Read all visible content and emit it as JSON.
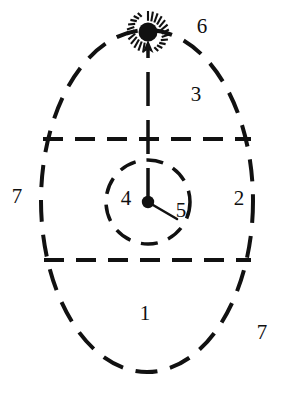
{
  "figure": {
    "type": "schematic-cross-section",
    "background_color": "#ffffff",
    "line_color": "#111111",
    "line_style": "dashed"
  },
  "geometry": {
    "outer_ellipse": {
      "cx": 147,
      "cy": 201,
      "rx": 106,
      "ry": 171
    },
    "inner_circle": {
      "cx": 148,
      "cy": 202,
      "r": 42
    },
    "center_dot": {
      "cx": 148,
      "cy": 202,
      "r": 6
    },
    "upper_chord_y": 139,
    "lower_chord_y": 260,
    "chord_x_start": 43,
    "chord_x_end": 251,
    "axis_line": {
      "x": 148,
      "y_top": 44,
      "y_bottom": 202
    },
    "burst": {
      "cx": 148,
      "cy": 30,
      "inner_r": 9,
      "outer_r": 20,
      "rays": 24
    },
    "leader_5": {
      "x1": 154,
      "y1": 206,
      "x2": 176,
      "y2": 218
    }
  },
  "labels": [
    {
      "id": "label-1",
      "text": "1",
      "x": 145,
      "y": 315,
      "region": "lower-zone"
    },
    {
      "id": "label-2",
      "text": "2",
      "x": 239,
      "y": 200,
      "region": "right-inner-edge"
    },
    {
      "id": "label-3",
      "text": "3",
      "x": 196,
      "y": 96,
      "region": "upper-zone"
    },
    {
      "id": "label-4",
      "text": "4",
      "x": 126,
      "y": 200,
      "region": "inner-circle-left"
    },
    {
      "id": "label-5",
      "text": "5",
      "x": 181,
      "y": 212,
      "region": "leader-line-end"
    },
    {
      "id": "label-6",
      "text": "6",
      "x": 202,
      "y": 28,
      "region": "top-right-outside"
    },
    {
      "id": "label-7-left",
      "text": "7",
      "x": 17,
      "y": 198,
      "region": "left-outside"
    },
    {
      "id": "label-7-right",
      "text": "7",
      "x": 262,
      "y": 334,
      "region": "bottom-right-outside"
    }
  ]
}
